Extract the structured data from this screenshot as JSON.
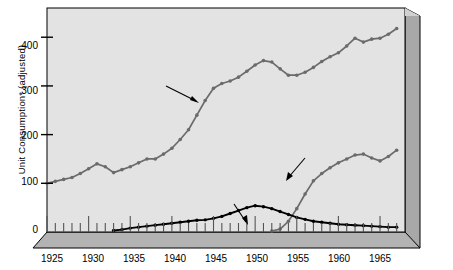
{
  "chart_data": {
    "type": "line",
    "title": "",
    "subtitle": "",
    "xlabel": "",
    "ylabel": "Unit Consumption* (adjusted)",
    "xlim": [
      1925,
      1968
    ],
    "ylim": [
      0,
      460
    ],
    "xticks": [
      "1925",
      "1930",
      "1935",
      "1940",
      "1945",
      "1950",
      "1955",
      "1960",
      "1965"
    ],
    "xtick_values": [
      1925,
      1930,
      1935,
      1940,
      1945,
      1950,
      1955,
      1960,
      1965
    ],
    "yticks": [
      "0",
      "100",
      "200",
      "300",
      "400"
    ],
    "ytick_values": [
      0,
      100,
      200,
      300,
      400
    ],
    "grid": false,
    "legend_position": "none",
    "series": [
      {
        "name": "A product category: cigarettes",
        "color": "#6b6b6b",
        "marker": "circle",
        "x": [
          1925,
          1926,
          1927,
          1928,
          1929,
          1930,
          1931,
          1932,
          1933,
          1934,
          1935,
          1936,
          1937,
          1938,
          1939,
          1940,
          1941,
          1942,
          1943,
          1944,
          1945,
          1946,
          1947,
          1948,
          1949,
          1950,
          1951,
          1952,
          1953,
          1954,
          1955,
          1956,
          1957,
          1958,
          1959,
          1960,
          1961,
          1962,
          1963,
          1964,
          1965,
          1966,
          1967
        ],
        "values": [
          100,
          104,
          108,
          112,
          120,
          130,
          140,
          134,
          122,
          128,
          134,
          142,
          150,
          150,
          160,
          172,
          190,
          210,
          240,
          270,
          295,
          305,
          310,
          318,
          330,
          343,
          352,
          349,
          335,
          322,
          322,
          328,
          338,
          350,
          360,
          368,
          382,
          398,
          390,
          396,
          398,
          406,
          418
        ]
      },
      {
        "name": "A product form: plain filter cigarettes",
        "color": "#6b6b6b",
        "marker": "circle",
        "x": [
          1952,
          1953,
          1954,
          1955,
          1956,
          1957,
          1958,
          1959,
          1960,
          1961,
          1962,
          1963,
          1964,
          1965,
          1966,
          1967
        ],
        "values": [
          2,
          6,
          22,
          48,
          78,
          105,
          120,
          132,
          142,
          150,
          158,
          160,
          152,
          146,
          155,
          168
        ]
      },
      {
        "name": "A brand: Philip Morris regular, non-filter",
        "color": "#000000",
        "marker": "circle",
        "x": [
          1933,
          1934,
          1935,
          1936,
          1937,
          1938,
          1939,
          1940,
          1941,
          1942,
          1943,
          1944,
          1945,
          1946,
          1947,
          1948,
          1949,
          1950,
          1951,
          1952,
          1953,
          1954,
          1955,
          1956,
          1957,
          1958,
          1959,
          1960,
          1961,
          1962,
          1963,
          1964,
          1965,
          1966,
          1967
        ],
        "values": [
          3,
          5,
          8,
          10,
          12,
          14,
          16,
          18,
          20,
          22,
          24,
          25,
          28,
          32,
          38,
          44,
          50,
          54,
          52,
          48,
          42,
          36,
          30,
          26,
          22,
          20,
          18,
          16,
          15,
          14,
          13,
          12,
          11,
          10,
          10
        ]
      }
    ],
    "annotations": [
      {
        "name": "cigarettes-annotation",
        "lines": [
          "A product category:",
          "cigarettes"
        ],
        "text": "A product category: cigarettes"
      },
      {
        "name": "plain-filter-annotation",
        "lines": [
          "A product form:",
          "plain filter",
          "cigarettes"
        ],
        "text": "A product form: plain filter cigarettes"
      },
      {
        "name": "philip-morris-annotation",
        "lines": [
          "A brand: Philip Morris",
          "regular, non-filter"
        ],
        "text": "A brand: Philip Morris regular, non-filter"
      }
    ],
    "colors": {
      "panel_background": "#e3e3e3",
      "side_panel": "#a8a8a8",
      "floor_panel": "#b5b5b5",
      "axis": "#000000",
      "gray_series": "#6b6b6b",
      "black_series": "#000000",
      "page_background": "#ffffff"
    }
  }
}
